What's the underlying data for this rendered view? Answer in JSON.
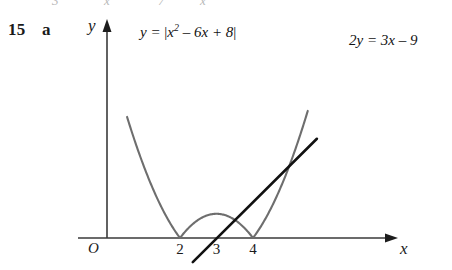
{
  "exercise": {
    "number": "15",
    "part": "a"
  },
  "top_remnant": {
    "fragment_1": "3",
    "fragment_2": "x",
    "fragment_3": "7",
    "fragment_4": "x"
  },
  "axes": {
    "y_label": "y",
    "x_label": "x",
    "origin_label": "O",
    "x_ticks": [
      "2",
      "3",
      "4"
    ],
    "y_arrow_icon": "arrow-up-icon",
    "x_arrow_icon": "arrow-right-icon"
  },
  "labels": {
    "curve": {
      "lhs": "y = ",
      "open_bar": "|",
      "base": "x",
      "exponent": "2",
      "rest": " – 6x + 8",
      "close_bar": "|",
      "plain": "y = |x² – 6x + 8|"
    },
    "line": {
      "plain": "2y = 3x – 9"
    }
  },
  "colors": {
    "curve": "#6e6e6e",
    "line": "#111111",
    "axis": "#3a3a3a",
    "background": "#ffffff",
    "text": "#1a1a1a"
  },
  "chart_data": {
    "type": "line",
    "title": "",
    "xlabel": "x",
    "ylabel": "y",
    "grid": false,
    "legend": "inline-annotations",
    "xlim": [
      -0.6,
      6.3
    ],
    "ylim": [
      -0.9,
      9.2
    ],
    "x_ticks": [
      2,
      3,
      4
    ],
    "y_ticks": [],
    "origin_label": "O",
    "series": [
      {
        "name": "y = |x² – 6x + 8|",
        "type": "absolute-value-parabola",
        "color": "#6e6e6e",
        "expression": "abs(x^2 - 6x + 8)",
        "roots": [
          2,
          4
        ],
        "local_max": {
          "x": 3,
          "y": 1
        },
        "domain": [
          0.55,
          5.5
        ],
        "points": [
          {
            "x": 0.55,
            "y": 5.0
          },
          {
            "x": 1.0,
            "y": 3.0
          },
          {
            "x": 1.5,
            "y": 1.25
          },
          {
            "x": 2.0,
            "y": 0.0
          },
          {
            "x": 2.5,
            "y": 0.75
          },
          {
            "x": 3.0,
            "y": 1.0
          },
          {
            "x": 3.5,
            "y": 0.75
          },
          {
            "x": 4.0,
            "y": 0.0
          },
          {
            "x": 4.5,
            "y": 1.25
          },
          {
            "x": 5.0,
            "y": 3.0
          },
          {
            "x": 5.5,
            "y": 5.75
          }
        ]
      },
      {
        "name": "2y = 3x – 9",
        "type": "straight-line",
        "color": "#111111",
        "expression": "y = 1.5x - 4.5",
        "slope": 1.5,
        "y_intercept": -4.5,
        "x_intercept": 3,
        "domain": [
          2.35,
          5.75
        ],
        "points": [
          {
            "x": 2.35,
            "y": -1.0
          },
          {
            "x": 5.75,
            "y": 4.1
          }
        ]
      }
    ],
    "intersections": [
      {
        "x": 4.58,
        "y": 2.37
      },
      {
        "x": 3.0,
        "y": 0.0
      }
    ],
    "annotations": [
      {
        "text": "y = |x² – 6x + 8|",
        "near": "curve-left-branch"
      },
      {
        "text": "2y = 3x – 9",
        "near": "line-top"
      }
    ]
  }
}
